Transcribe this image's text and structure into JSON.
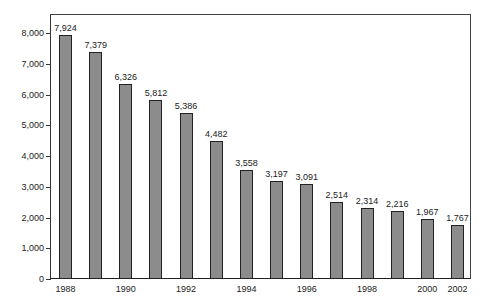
{
  "chart_data": {
    "type": "bar",
    "title": "",
    "xlabel": "",
    "ylabel": "",
    "categories": [
      "1988",
      "1989",
      "1990",
      "1991",
      "1992",
      "1993",
      "1994",
      "1995",
      "1996",
      "1997",
      "1998",
      "1999",
      "2000",
      "2002"
    ],
    "values": [
      7924,
      7379,
      6326,
      5812,
      5386,
      4482,
      3558,
      3197,
      3091,
      2514,
      2314,
      2216,
      1967,
      1767
    ],
    "value_labels": [
      "7,924",
      "7,379",
      "6,326",
      "5,812",
      "5,386",
      "4,482",
      "3,558",
      "3,197",
      "3,091",
      "2,514",
      "2,314",
      "2,216",
      "1,967",
      "1,767"
    ],
    "x_tick_labels": [
      "1988",
      "1990",
      "1992",
      "1994",
      "1996",
      "1998",
      "2000",
      "2002"
    ],
    "y_tick_labels": [
      "0",
      "1,000",
      "2,000",
      "3,000",
      "4,000",
      "5,000",
      "6,000",
      "7,000",
      "8,000"
    ],
    "ylim": [
      0,
      8500
    ],
    "grid": false,
    "legend": null,
    "bar_color": "#8c8c8c",
    "bar_edge_color": "#222222"
  }
}
